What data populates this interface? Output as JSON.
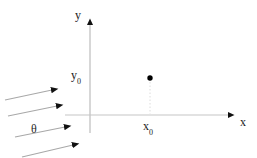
{
  "figure": {
    "background_color": "#ffffff",
    "width": 257,
    "height": 158,
    "axes": {
      "stroke_color": "#bdbdbd",
      "arrow_color": "#111111",
      "y_axis": {
        "label": "y",
        "x": 90,
        "y_top": 20,
        "y_bottom": 133
      },
      "x_axis": {
        "label": "x",
        "y": 115,
        "x_left": 65,
        "x_right": 234
      }
    },
    "tick_labels": {
      "y0": "y",
      "y0_sub": "0",
      "x0": "x",
      "x0_sub": "0"
    },
    "point": {
      "name": "marked-point",
      "cx": 150,
      "cy": 78,
      "r": 2.6,
      "color": "#000000"
    },
    "dropline": {
      "from_x": 150,
      "from_y": 81,
      "to_x": 150,
      "to_y": 114,
      "color": "#d8d8d8"
    },
    "angle_label": "θ",
    "flow_arrows": [
      {
        "x1": 5,
        "y1": 100,
        "x2": 57,
        "y2": 89
      },
      {
        "x1": 8,
        "y1": 116,
        "x2": 62,
        "y2": 105
      },
      {
        "x1": 15,
        "y1": 137,
        "x2": 70,
        "y2": 126
      },
      {
        "x1": 22,
        "y1": 156,
        "x2": 78,
        "y2": 144
      }
    ],
    "flow_arrow_color": "#9a9a9a",
    "flow_arrow_head_color": "#111111"
  }
}
